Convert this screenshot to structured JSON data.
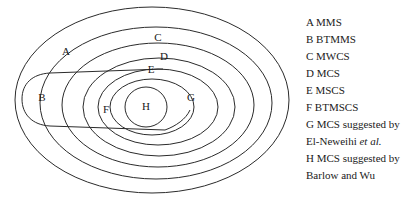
{
  "figure": {
    "type": "nested-set-venn-diagram",
    "stroke_color": "#2b2b2b",
    "background_color": "#ffffff",
    "text_color": "#1a1a1a"
  },
  "diagram": {
    "regions": [
      {
        "key": "A",
        "label": "A",
        "x": 66,
        "y": 52,
        "set_name": "MMS"
      },
      {
        "key": "B",
        "label": "B",
        "x": 42,
        "y": 98,
        "set_name": "BTMMS"
      },
      {
        "key": "C",
        "label": "C",
        "x": 158,
        "y": 38,
        "set_name": "MWCS"
      },
      {
        "key": "D",
        "label": "D",
        "x": 164,
        "y": 57,
        "set_name": "MCS"
      },
      {
        "key": "E",
        "label": "E",
        "x": 151,
        "y": 70,
        "set_name": "MSCS"
      },
      {
        "key": "F",
        "label": "F",
        "x": 106,
        "y": 110,
        "set_name": "BTMSCS"
      },
      {
        "key": "G",
        "label": "G",
        "x": 191,
        "y": 98,
        "set_name": "MCS suggested by El-Neweihi et al."
      },
      {
        "key": "H",
        "label": "H",
        "x": 146,
        "y": 107,
        "set_name": "MCS suggested by Barlow and Wu"
      }
    ]
  },
  "legend": {
    "entries": [
      {
        "key": "A",
        "line1": "A MMS",
        "line2": "",
        "line2_italic": ""
      },
      {
        "key": "B",
        "line1": "B BTMMS",
        "line2": "",
        "line2_italic": ""
      },
      {
        "key": "C",
        "line1": "C MWCS",
        "line2": "",
        "line2_italic": ""
      },
      {
        "key": "D",
        "line1": "D MCS",
        "line2": "",
        "line2_italic": ""
      },
      {
        "key": "E",
        "line1": "E MSCS",
        "line2": "",
        "line2_italic": ""
      },
      {
        "key": "F",
        "line1": "F BTMSCS",
        "line2": "",
        "line2_italic": ""
      },
      {
        "key": "G",
        "line1": "G MCS suggested by",
        "line2": "El-Neweihi ",
        "line2_italic": "et al."
      },
      {
        "key": "H",
        "line1": "H MCS suggested by",
        "line2": "Barlow and Wu",
        "line2_italic": ""
      }
    ]
  }
}
